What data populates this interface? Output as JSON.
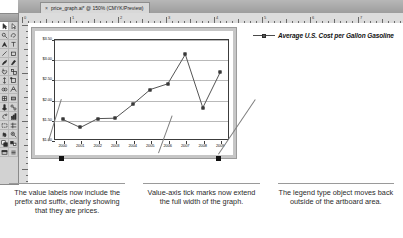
{
  "window": {
    "tab_title": "price_graph.ai* @ 150% (CMYK/Preview)",
    "close_glyph": "×"
  },
  "toolbox": {
    "tools": [
      {
        "name": "selection-tool",
        "selected": true
      },
      {
        "name": "direct-selection-tool",
        "selected": false
      },
      {
        "name": "magic-wand-tool",
        "selected": false
      },
      {
        "name": "lasso-tool",
        "selected": false
      },
      {
        "name": "pen-tool",
        "selected": false
      },
      {
        "name": "type-tool",
        "selected": false
      },
      {
        "name": "line-segment-tool",
        "selected": false
      },
      {
        "name": "rectangle-tool",
        "selected": false
      },
      {
        "name": "paintbrush-tool",
        "selected": false
      },
      {
        "name": "pencil-tool",
        "selected": false
      },
      {
        "name": "rotate-tool",
        "selected": false
      },
      {
        "name": "scale-tool",
        "selected": false
      },
      {
        "name": "width-tool",
        "selected": false
      },
      {
        "name": "free-transform-tool",
        "selected": false
      },
      {
        "name": "shape-builder-tool",
        "selected": false
      },
      {
        "name": "perspective-grid-tool",
        "selected": false
      },
      {
        "name": "mesh-tool",
        "selected": false
      },
      {
        "name": "gradient-tool",
        "selected": false
      },
      {
        "name": "eyedropper-tool",
        "selected": false
      },
      {
        "name": "blend-tool",
        "selected": false
      },
      {
        "name": "symbol-sprayer-tool",
        "selected": false
      },
      {
        "name": "column-graph-tool",
        "selected": false
      },
      {
        "name": "artboard-tool",
        "selected": false
      },
      {
        "name": "slice-tool",
        "selected": false
      },
      {
        "name": "hand-tool",
        "selected": false
      },
      {
        "name": "zoom-tool",
        "selected": false
      },
      {
        "name": "fill-stroke-swatch",
        "selected": false
      },
      {
        "name": "color-mode-swatch",
        "selected": false
      },
      {
        "name": "screen-mode-button",
        "selected": false
      },
      {
        "name": "panel-options-button",
        "selected": false
      }
    ]
  },
  "rulers": {
    "horizontal_numbers": [
      "0",
      "1",
      "2",
      "3",
      "4",
      "5",
      "6",
      "7"
    ],
    "unit_hint": "in"
  },
  "chart_data": {
    "type": "line",
    "title": "",
    "xlabel": "",
    "ylabel": "",
    "legend": [
      "Average U.S. Cost per Gallon Gasoline"
    ],
    "legend_position": "outside-right",
    "grid": true,
    "ylim": [
      1.0,
      3.5
    ],
    "ytick_labels": [
      "$3.50",
      "$3.00",
      "$2.50",
      "$2.00",
      "$1.50",
      "$1.00"
    ],
    "ytick_values": [
      3.5,
      3.0,
      2.5,
      2.0,
      1.5,
      1.0
    ],
    "value_prefix": "$",
    "value_suffix": "",
    "categories": [
      "2000",
      "2001",
      "2002",
      "2003",
      "2004",
      "2005",
      "2006",
      "2007",
      "2008",
      "2009"
    ],
    "series": [
      {
        "name": "Average U.S. Cost per Gallon Gasoline",
        "values": [
          1.51,
          1.31,
          1.53,
          1.54,
          1.88,
          2.25,
          2.39,
          3.12,
          1.8,
          2.68
        ]
      }
    ]
  },
  "legend": {
    "label": "Average U.S. Cost per Gallon Gasoline"
  },
  "captions": [
    {
      "name": "caption-value-labels",
      "text": "The value labels now include the prefix and suffix, clearly showing that they are prices."
    },
    {
      "name": "caption-tick-marks",
      "text": "Value-axis tick marks now extend the full width of the graph."
    },
    {
      "name": "caption-legend-position",
      "text": "The legend type object moves back outside of the artboard area."
    }
  ]
}
